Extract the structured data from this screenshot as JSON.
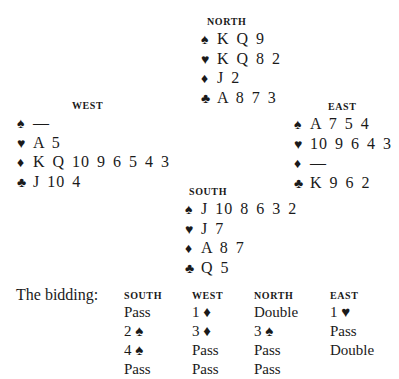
{
  "suit_symbols": {
    "spades": "♠",
    "hearts": "♥",
    "diamonds": "♦",
    "clubs": "♣"
  },
  "hands": {
    "north": {
      "title": "NORTH",
      "spades": "K Q 9",
      "hearts": "K Q 8 2",
      "diamonds": "J 2",
      "clubs": "A 8 7 3"
    },
    "west": {
      "title": "WEST",
      "spades": "—",
      "hearts": "A 5",
      "diamonds": "K Q 10 9 6 5 4 3",
      "clubs": "J 10 4"
    },
    "east": {
      "title": "EAST",
      "spades": "A 7 5 4",
      "hearts": "10 9 6 4 3",
      "diamonds": "—",
      "clubs": "K 9 6 2"
    },
    "south": {
      "title": "SOUTH",
      "spades": "J 10 8 6 3 2",
      "hearts": "J 7",
      "diamonds": "A 8 7",
      "clubs": "Q 5"
    }
  },
  "bidding": {
    "label": "The bidding:",
    "columns": [
      {
        "header": "SOUTH",
        "calls": [
          "Pass",
          "2 ♠",
          "4 ♠",
          "Pass"
        ]
      },
      {
        "header": "WEST",
        "calls": [
          "1 ♦",
          "3 ♦",
          "Pass",
          "Pass"
        ]
      },
      {
        "header": "NORTH",
        "calls": [
          "Double",
          "3 ♠",
          "Pass",
          "Pass"
        ]
      },
      {
        "header": "EAST",
        "calls": [
          "1 ♥",
          "Pass",
          "Double"
        ]
      }
    ]
  }
}
